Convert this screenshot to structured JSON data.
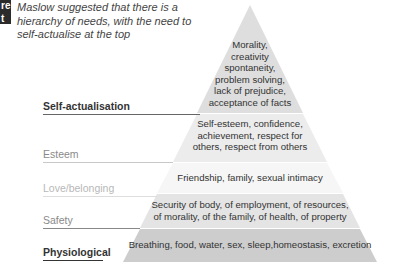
{
  "header": {
    "tag_lines": [
      "re",
      "t"
    ],
    "caption": "Maslow suggested that there is a hierarchy of needs, with the need to self-actualise at the top"
  },
  "pyramid": {
    "levels": [
      {
        "label": "Self-actualisation",
        "label_color": "#333333",
        "line_color": "#666666",
        "fill": "#dedede",
        "description": "Morality,\ncreativity\nspontaneity,\nproblem solving,\nlack of prejudice,\nacceptance of facts"
      },
      {
        "label": "Esteem",
        "label_color": "#8a8a8a",
        "line_color": "#c8c8c8",
        "fill": "#ececec",
        "description": "Self-esteem, confidence,\nachievement, respect for\nothers, respect from others"
      },
      {
        "label": "Love/belonging",
        "label_color": "#b8b8b8",
        "line_color": "#dddddd",
        "fill": "#f6f6f6",
        "description": "Friendship, family, sexual intimacy"
      },
      {
        "label": "Safety",
        "label_color": "#8a8a8a",
        "line_color": "#888888",
        "fill": "#e4e4e4",
        "description": "Security of body, of employment, of resources,\nof morality, of the family, of health, of property"
      },
      {
        "label": "Physiological",
        "label_color": "#333333",
        "line_color": "#333333",
        "fill": "#cdcdcd",
        "description": "Breathing, food, water, sex, sleep,homeostasis, excretion"
      }
    ]
  }
}
